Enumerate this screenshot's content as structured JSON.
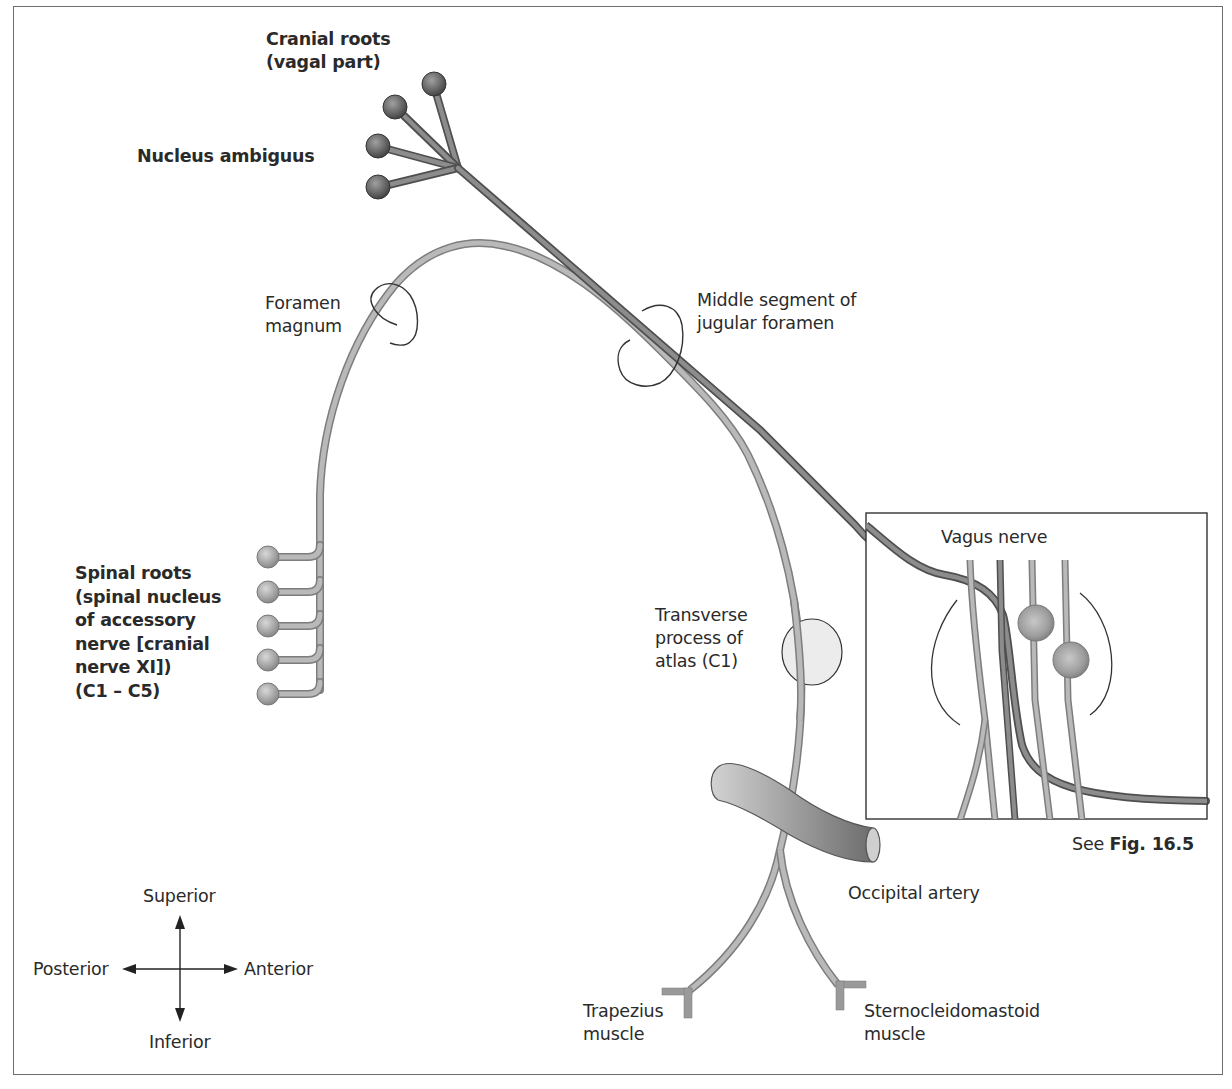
{
  "figure": {
    "labels": {
      "cranial_roots": "Cranial roots\n(vagal part)",
      "nucleus_ambiguus": "Nucleus ambiguus",
      "foramen_magnum": "Foramen\nmagnum",
      "jugular_foramen": "Middle segment of\njugular foramen",
      "spinal_roots": "Spinal roots\n(spinal nucleus\nof accessory\nnerve [cranial\nnerve XI])\n(C1 – C5)",
      "transverse_process": "Transverse\nprocess of\natlas (C1)",
      "vagus_nerve": "Vagus nerve",
      "see_fig_prefix": "See ",
      "see_fig_ref": "Fig. 16.5",
      "occipital_artery": "Occipital artery",
      "trapezius": "Trapezius\nmuscle",
      "sternocleidomastoid": "Sternocleidomastoid\nmuscle"
    },
    "orientation": {
      "superior": "Superior",
      "inferior": "Inferior",
      "posterior": "Posterior",
      "anterior": "Anterior"
    },
    "colors": {
      "cranial_nerve": "#6f6f6f",
      "spinal_nerve": "#a8a8a8",
      "artery": "#8a8a8a",
      "outline": "#333333"
    }
  }
}
